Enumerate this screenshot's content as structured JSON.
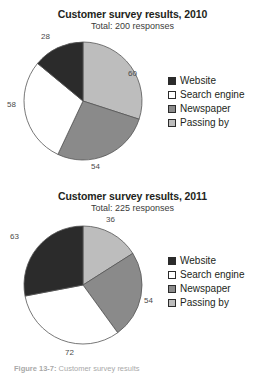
{
  "figure": {
    "caption_prefix": "Figure 13-7:",
    "caption_text": "Customer survey results"
  },
  "charts": [
    {
      "id": "chart-1",
      "title": "Customer survey results, 2010",
      "subtitle": "Total: 200 responses",
      "legend": [
        {
          "label": "Website",
          "color": "#2b2b2b"
        },
        {
          "label": "Search engine",
          "color": "#ffffff"
        },
        {
          "label": "Newspaper",
          "color": "#8a8a8a"
        },
        {
          "label": "Passing by",
          "color": "#bdbdbd"
        }
      ],
      "labels": {
        "passing_by": "60",
        "newspaper": "54",
        "search_engine": "58",
        "website": "28"
      }
    },
    {
      "id": "chart-2",
      "title": "Customer survey results, 2011",
      "subtitle": "Total: 225 responses",
      "legend": [
        {
          "label": "Website",
          "color": "#2b2b2b"
        },
        {
          "label": "Search engine",
          "color": "#ffffff"
        },
        {
          "label": "Newspaper",
          "color": "#8a8a8a"
        },
        {
          "label": "Passing by",
          "color": "#bdbdbd"
        }
      ],
      "labels": {
        "passing_by": "36",
        "newspaper": "54",
        "search_engine": "72",
        "website": "63"
      }
    }
  ],
  "chart_data": [
    {
      "type": "pie",
      "title": "Customer survey results, 2010",
      "subtitle": "Total: 200 responses",
      "total": 200,
      "categories": [
        "Passing by",
        "Newspaper",
        "Search engine",
        "Website"
      ],
      "values": [
        60,
        54,
        58,
        28
      ],
      "colors": [
        "#bdbdbd",
        "#8a8a8a",
        "#ffffff",
        "#2b2b2b"
      ],
      "legend_order": [
        "Website",
        "Search engine",
        "Newspaper",
        "Passing by"
      ],
      "legend_position": "right",
      "start_angle_deg": 0,
      "direction": "clockwise",
      "data_labels": true
    },
    {
      "type": "pie",
      "title": "Customer survey results, 2011",
      "subtitle": "Total: 225 responses",
      "total": 225,
      "categories": [
        "Passing by",
        "Newspaper",
        "Search engine",
        "Website"
      ],
      "values": [
        36,
        54,
        72,
        63
      ],
      "colors": [
        "#bdbdbd",
        "#8a8a8a",
        "#ffffff",
        "#2b2b2b"
      ],
      "legend_order": [
        "Website",
        "Search engine",
        "Newspaper",
        "Passing by"
      ],
      "legend_position": "right",
      "start_angle_deg": 0,
      "direction": "clockwise",
      "data_labels": true
    }
  ]
}
